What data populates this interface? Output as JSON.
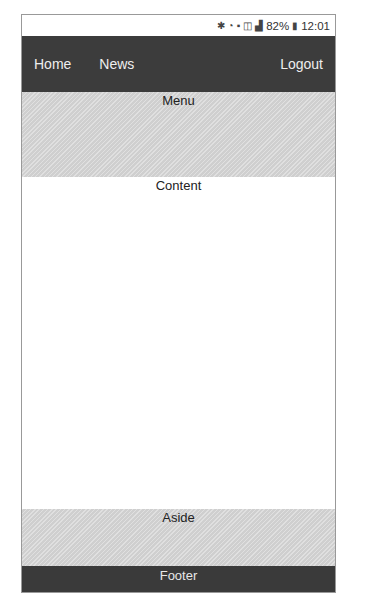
{
  "status_bar": {
    "icons": [
      "bluetooth-icon",
      "wifi-icon",
      "sim-icon",
      "data-icon",
      "signal-icon",
      "battery-icon"
    ],
    "battery": "82%",
    "time": "12:01"
  },
  "nav": {
    "items": [
      {
        "label": "Home"
      },
      {
        "label": "News"
      }
    ],
    "logout_label": "Logout"
  },
  "menu": {
    "label": "Menu"
  },
  "content": {
    "label": "Content"
  },
  "aside": {
    "label": "Aside"
  },
  "footer": {
    "label": "Footer"
  },
  "colors": {
    "nav_bg": "#3c3c3c",
    "hatch_bg": "#cfcfcf",
    "footer_bg": "#3a3a3a"
  }
}
